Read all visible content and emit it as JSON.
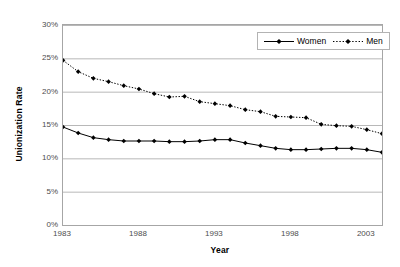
{
  "chart_data": {
    "type": "line",
    "title": "",
    "xlabel": "Year",
    "ylabel": "Unionization Rate",
    "xlim": [
      1983,
      2004
    ],
    "ylim": [
      0,
      30
    ],
    "grid": true,
    "grid_axis": "y",
    "legend_position": "top-right",
    "x_tick_labels": [
      "1983",
      "1988",
      "1993",
      "1998",
      "2003"
    ],
    "x_ticks": [
      1983,
      1988,
      1993,
      1998,
      2003
    ],
    "y_tick_labels": [
      "0%",
      "5%",
      "10%",
      "15%",
      "20%",
      "25%",
      "30%"
    ],
    "y_ticks": [
      0,
      5,
      10,
      15,
      20,
      25,
      30
    ],
    "y_unit": "%",
    "x": [
      1983,
      1984,
      1985,
      1986,
      1987,
      1988,
      1989,
      1990,
      1991,
      1992,
      1993,
      1994,
      1995,
      1996,
      1997,
      1998,
      1999,
      2000,
      2001,
      2002,
      2003,
      2004
    ],
    "series": [
      {
        "name": "Women",
        "line_style": "solid",
        "marker": "diamond",
        "color": "#000000",
        "values": [
          14.7,
          13.8,
          13.1,
          12.8,
          12.6,
          12.6,
          12.6,
          12.5,
          12.5,
          12.6,
          12.8,
          12.8,
          12.3,
          11.9,
          11.5,
          11.3,
          11.3,
          11.4,
          11.5,
          11.5,
          11.3,
          10.9
        ]
      },
      {
        "name": "Men",
        "line_style": "dotted",
        "marker": "diamond",
        "color": "#000000",
        "values": [
          24.7,
          23.0,
          22.0,
          21.5,
          20.9,
          20.4,
          19.7,
          19.2,
          19.3,
          18.5,
          18.2,
          17.9,
          17.3,
          17.0,
          16.3,
          16.2,
          16.1,
          15.1,
          14.9,
          14.8,
          14.3,
          13.7
        ]
      }
    ]
  },
  "legend": {
    "entries": [
      {
        "label": "Women"
      },
      {
        "label": "Men"
      }
    ]
  },
  "axis_titles": {
    "y": "Unionization Rate",
    "x": "Year"
  }
}
